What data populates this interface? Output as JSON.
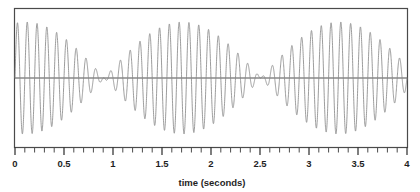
{
  "chart_data": {
    "type": "line",
    "title": "",
    "subtitle": "",
    "xlabel": "time (seconds)",
    "ylabel": "",
    "xlim": [
      0,
      4
    ],
    "ylim": [
      -1.15,
      1.15
    ],
    "grid": false,
    "legend": null,
    "xticks": [
      0,
      0.5,
      1,
      1.5,
      2,
      2.5,
      3,
      3.5,
      4
    ],
    "xticklabels": [
      "0",
      "0.5",
      "1",
      "1.5",
      "2",
      "2.5",
      "3",
      "3.5",
      "4"
    ],
    "minor_tick_interval": 0.1,
    "yticks": [],
    "yticklabels": [],
    "zero_line": 0,
    "series": [
      {
        "name": "beat waveform",
        "color": "#8a8a8a",
        "carrier_frequency_hz": 10.0,
        "beat_frequency_hz": 0.625,
        "beat_period_seconds": 1.6,
        "envelope_amplitude": 1.0,
        "nodes_seconds": [
          0.91,
          2.51,
          4.11
        ],
        "antinodes_seconds": [
          0.11,
          1.71,
          3.31
        ],
        "formula": "y = cos(2*pi*0.3125*(t-0.11)) * sin(2*pi*10*t)"
      }
    ]
  },
  "figure": {
    "frame_color": "#4a4a4a",
    "zero_line_color": "#4f4f4f",
    "curve_color": "#8a8a8a",
    "background_color": "#ffffff",
    "text_color": "#1f1f1f"
  }
}
